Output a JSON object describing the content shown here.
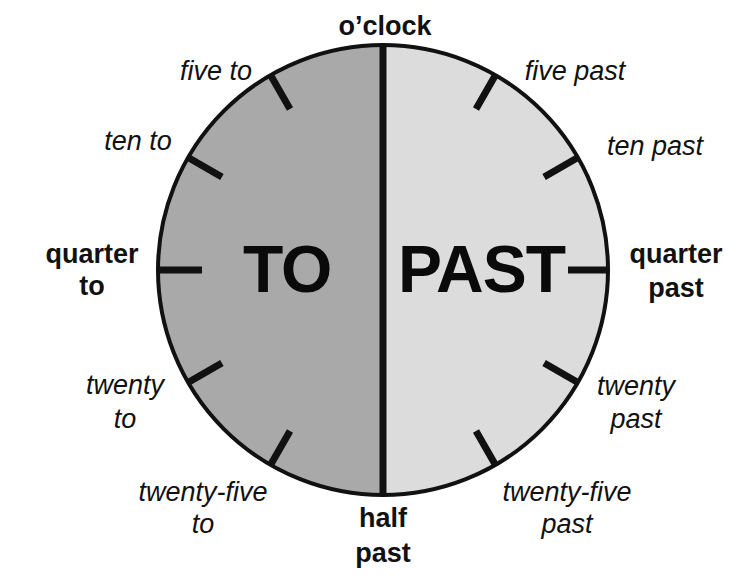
{
  "diagram": {
    "type": "clock-time-phrases",
    "colors": {
      "to_half": "#a9a9a9",
      "past_half": "#dcdcdc",
      "outline": "#111111",
      "text": "#111111"
    },
    "halves": {
      "left": "TO",
      "right": "PAST"
    },
    "labels": {
      "top": "o’clock",
      "five_to": "five to",
      "ten_to": "ten to",
      "quarter_to_1": "quarter",
      "quarter_to_2": "to",
      "twenty_to_1": "twenty",
      "twenty_to_2": "to",
      "twentyfive_to_1": "twenty-five",
      "twentyfive_to_2": "to",
      "half_past_1": "half",
      "half_past_2": "past",
      "five_past": "five past",
      "ten_past": "ten past",
      "quarter_past_1": "quarter",
      "quarter_past_2": "past",
      "twenty_past_1": "twenty",
      "twenty_past_2": "past",
      "twentyfive_past_1": "twenty-five",
      "twentyfive_past_2": "past"
    }
  }
}
